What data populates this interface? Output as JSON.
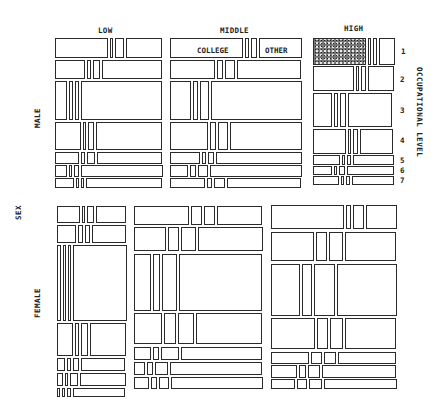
{
  "chart_data": {
    "type": "mosaic",
    "title": "",
    "variables": {
      "sex": [
        "MALE",
        "FEMALE"
      ],
      "status": [
        "LOW",
        "MIDDLE",
        "HIGH"
      ],
      "occupational_level": [
        "1",
        "2",
        "3",
        "4",
        "5",
        "6",
        "7"
      ],
      "education": [
        "COLLEGE",
        "E2",
        "E3",
        "OTHER"
      ]
    },
    "axis_labels": {
      "left": "SEX",
      "right": "OCCUPATIONAL LEVEL",
      "top": [
        "LOW",
        "MIDDLE",
        "HIGH"
      ],
      "row_groups": [
        "MALE",
        "FEMALE"
      ],
      "level_ticks": [
        "1",
        "2",
        "3",
        "4",
        "5",
        "6",
        "7"
      ]
    },
    "annotations": [
      "COLLEGE",
      "OTHER"
    ],
    "highlight": {
      "sex": "MALE",
      "status": "HIGH",
      "occupational_level": "1",
      "education": "COLLEGE",
      "fill": "stippled"
    },
    "blocks": {
      "MALE": {
        "LOW": {
          "x": 55,
          "w": 107,
          "rows": [
            [
              38,
              20
            ],
            [
              60,
              19
            ],
            [
              81,
              39
            ],
            [
              122,
              28
            ],
            [
              152,
              12
            ],
            [
              165,
              12
            ],
            [
              178,
              10
            ]
          ],
          "splits": [
            [
              0.52,
              0.03,
              0.09,
              0.36
            ],
            [
              0.3,
              0.04,
              0.07,
              0.59
            ],
            [
              0.12,
              0.04,
              0.04,
              0.8
            ],
            [
              0.26,
              0.03,
              0.06,
              0.65
            ],
            [
              0.24,
              0.04,
              0.08,
              0.64
            ],
            [
              0.12,
              0.02,
              0.05,
              0.81
            ],
            [
              0.19,
              0.03,
              0.03,
              0.75
            ]
          ]
        },
        "MIDDLE": {
          "x": 170,
          "w": 132,
          "rows": [
            [
              38,
              20
            ],
            [
              60,
              19
            ],
            [
              81,
              39
            ],
            [
              122,
              28
            ],
            [
              152,
              12
            ],
            [
              165,
              12
            ],
            [
              178,
              10
            ]
          ],
          "splits": [
            [
              0.58,
              0.03,
              0.05,
              0.34
            ],
            [
              0.36,
              0.05,
              0.08,
              0.51
            ],
            [
              0.17,
              0.04,
              0.07,
              0.72
            ],
            [
              0.3,
              0.05,
              0.08,
              0.57
            ],
            [
              0.24,
              0.03,
              0.05,
              0.68
            ],
            [
              0.14,
              0.05,
              0.08,
              0.73
            ],
            [
              0.28,
              0.04,
              0.09,
              0.59
            ]
          ]
        },
        "HIGH": {
          "x": 313,
          "w": 80,
          "rows": [
            [
              38,
              27
            ],
            [
              66,
              25
            ],
            [
              93,
              34
            ],
            [
              129,
              25
            ],
            [
              155,
              10
            ],
            [
              166,
              9
            ],
            [
              176,
              9
            ]
          ],
          "splits": [
            [
              0.72,
              0.02,
              0.05,
              0.21
            ],
            [
              0.55,
              0.03,
              0.07,
              0.35
            ],
            [
              0.26,
              0.06,
              0.08,
              0.6
            ],
            [
              0.45,
              0.04,
              0.07,
              0.44
            ],
            [
              0.36,
              0.03,
              0.06,
              0.55
            ],
            [
              0.25,
              0.03,
              0.08,
              0.64
            ],
            [
              0.35,
              0.03,
              0.05,
              0.57
            ]
          ]
        }
      },
      "FEMALE": {
        "LOW": {
          "x": 57,
          "w": 69,
          "rows": [
            [
              206,
              17
            ],
            [
              225,
              18
            ],
            [
              245,
              76
            ],
            [
              323,
              33
            ],
            [
              358,
              13
            ],
            [
              373,
              13
            ],
            [
              388,
              9
            ]
          ],
          "splits": [
            [
              0.36,
              0.05,
              0.11,
              0.48
            ],
            [
              0.3,
              0.08,
              0.08,
              0.54
            ],
            [
              0.06,
              0.04,
              0.04,
              0.86
            ],
            [
              0.26,
              0.06,
              0.11,
              0.57
            ],
            [
              0.13,
              0.07,
              0.1,
              0.7
            ],
            [
              0.09,
              0.05,
              0.13,
              0.73
            ],
            [
              0.05,
              0.05,
              0.07,
              0.83
            ]
          ]
        },
        "MIDDLE": {
          "x": 134,
          "w": 128,
          "rows": [
            [
              206,
              19
            ],
            [
              227,
              24
            ],
            [
              254,
              57
            ],
            [
              313,
              31
            ],
            [
              347,
              13
            ],
            [
              362,
              13
            ],
            [
              377,
              12
            ]
          ],
          "splits": [
            [
              0.45,
              0.09,
              0.09,
              0.37
            ],
            [
              0.26,
              0.09,
              0.12,
              0.53
            ],
            [
              0.14,
              0.06,
              0.12,
              0.68
            ],
            [
              0.23,
              0.1,
              0.13,
              0.54
            ],
            [
              0.14,
              0.05,
              0.15,
              0.66
            ],
            [
              0.09,
              0.05,
              0.11,
              0.75
            ],
            [
              0.12,
              0.05,
              0.08,
              0.75
            ]
          ]
        },
        "HIGH": {
          "x": 271,
          "w": 125,
          "rows": [
            [
              205,
              24
            ],
            [
              232,
              29
            ],
            [
              264,
              52
            ],
            [
              318,
              31
            ],
            [
              352,
              12
            ],
            [
              365,
              13
            ],
            [
              379,
              10
            ]
          ],
          "splits": [
            [
              0.61,
              0.04,
              0.09,
              0.26
            ],
            [
              0.36,
              0.09,
              0.12,
              0.43
            ],
            [
              0.24,
              0.08,
              0.18,
              0.5
            ],
            [
              0.37,
              0.09,
              0.11,
              0.43
            ],
            [
              0.32,
              0.09,
              0.1,
              0.49
            ],
            [
              0.22,
              0.06,
              0.1,
              0.62
            ],
            [
              0.2,
              0.08,
              0.11,
              0.61
            ]
          ]
        }
      }
    },
    "layout": {
      "grid": false,
      "legend": "right"
    }
  },
  "labels": {
    "top_low": "LOW",
    "top_middle": "MIDDLE",
    "top_high": "HIGH",
    "left_sex": "SEX",
    "left_male": "MALE",
    "left_female": "FEMALE",
    "right_title": "OCCUPATIONAL LEVEL",
    "college": "COLLEGE",
    "other": "OTHER",
    "levels": [
      "1",
      "2",
      "3",
      "4",
      "5",
      "6",
      "7"
    ]
  }
}
